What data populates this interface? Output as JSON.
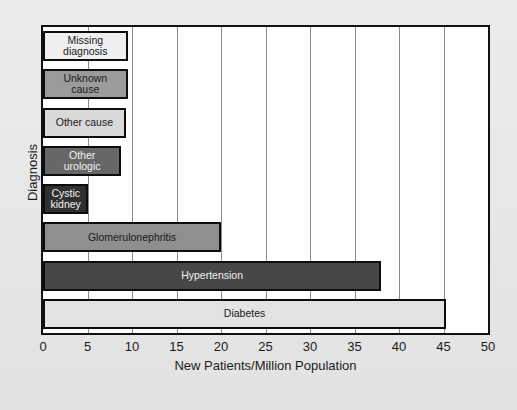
{
  "chart_data": {
    "type": "bar",
    "orientation": "horizontal",
    "title": "",
    "xlabel": "New Patients/Million Population",
    "ylabel": "Diagnosis",
    "xlim": [
      0,
      50
    ],
    "xticks": [
      0,
      5,
      10,
      15,
      20,
      25,
      30,
      35,
      40,
      45,
      50
    ],
    "grid": "vertical",
    "legend": "none",
    "categories": [
      "Missing diagnosis",
      "Unknown cause",
      "Other cause",
      "Other urologic",
      "Cystic kidney",
      "Glomerulonephritis",
      "Hypertension",
      "Diabetes"
    ],
    "values": [
      9.5,
      9.5,
      9.3,
      8.8,
      5.1,
      20.0,
      38.0,
      45.3
    ],
    "bars": [
      {
        "label": "Missing\ndiagnosis",
        "category": "Missing diagnosis",
        "value": 9.5,
        "color": "#efefef",
        "text_color": "dark",
        "label_position": "center"
      },
      {
        "label": "Unknown cause",
        "category": "Unknown cause",
        "value": 9.5,
        "color": "#9b9b9b",
        "text_color": "dark",
        "label_position": "center"
      },
      {
        "label": "Other cause",
        "category": "Other cause",
        "value": 9.3,
        "color": "#d9d9d9",
        "text_color": "dark",
        "label_position": "center"
      },
      {
        "label": "Other\nurologic",
        "category": "Other urologic",
        "value": 8.8,
        "color": "#676767",
        "text_color": "light",
        "label_position": "center"
      },
      {
        "label": "Cystic\nkidney",
        "category": "Cystic kidney",
        "value": 5.1,
        "color": "#303030",
        "text_color": "light",
        "label_position": "center"
      },
      {
        "label": "Glomerulonephritis",
        "category": "Glomerulonephritis",
        "value": 20.0,
        "color": "#8f8f8f",
        "text_color": "dark",
        "label_position": "center"
      },
      {
        "label": "Hypertension",
        "category": "Hypertension",
        "value": 38.0,
        "color": "#474747",
        "text_color": "light",
        "label_position": "center"
      },
      {
        "label": "Diabetes",
        "category": "Diabetes",
        "value": 45.3,
        "color": "#e3e3e3",
        "text_color": "dark",
        "label_position": "center"
      }
    ]
  },
  "style": {
    "page_background": "#e9e9e9",
    "plot_background": "#ffffff",
    "frame_color": "#111111",
    "grid_color": "#8a8a8a",
    "bar_edge_color": "#0d0d0d"
  }
}
